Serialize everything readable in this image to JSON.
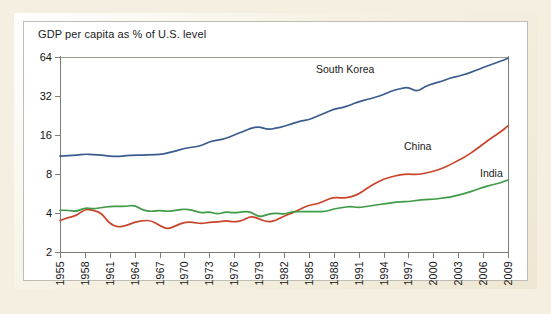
{
  "chart_title": "GDP per capita as % of U.S. level",
  "labels": {
    "south_korea": "South Korea",
    "china": "China",
    "india": "India"
  },
  "colors": {
    "south_korea": "#3b5c8f",
    "china": "#c8452a",
    "india": "#3f9b45",
    "axis": "#7d7d76",
    "frame_cream": "#f4efe0",
    "panel": "#ffffff"
  },
  "y_ticks": [
    "2",
    "4",
    "8",
    "16",
    "32",
    "64"
  ],
  "x_ticks": [
    "1955",
    "1958",
    "1961",
    "1964",
    "1967",
    "1970",
    "1973",
    "1976",
    "1979",
    "1982",
    "1985",
    "1988",
    "1991",
    "1994",
    "1997",
    "2000",
    "2003",
    "2006",
    "2009"
  ],
  "chart_data": {
    "type": "line",
    "title": "GDP per capita as % of U.S. level",
    "xlabel": "",
    "ylabel": "GDP per capita as % of U.S. level",
    "yscale": "log2",
    "ylim": [
      2,
      64
    ],
    "ytick_values": [
      2,
      4,
      8,
      16,
      32,
      64
    ],
    "xlim": [
      1955,
      2009
    ],
    "xtick_values": [
      1955,
      1958,
      1961,
      1964,
      1967,
      1970,
      1973,
      1976,
      1979,
      1982,
      1985,
      1988,
      1991,
      1994,
      1997,
      2000,
      2003,
      2006,
      2009
    ],
    "grid": false,
    "legend": "inline-annotations",
    "x": [
      1955,
      1956,
      1957,
      1958,
      1959,
      1960,
      1961,
      1962,
      1963,
      1964,
      1965,
      1966,
      1967,
      1968,
      1969,
      1970,
      1971,
      1972,
      1973,
      1974,
      1975,
      1976,
      1977,
      1978,
      1979,
      1980,
      1981,
      1982,
      1983,
      1984,
      1985,
      1986,
      1987,
      1988,
      1989,
      1990,
      1991,
      1992,
      1993,
      1994,
      1995,
      1996,
      1997,
      1998,
      1999,
      2000,
      2001,
      2002,
      2003,
      2004,
      2005,
      2006,
      2007,
      2008,
      2009
    ],
    "series": [
      {
        "name": "South Korea",
        "color": "#3b5c8f",
        "values": [
          11.0,
          11.1,
          11.2,
          11.4,
          11.3,
          11.2,
          11.0,
          10.9,
          11.1,
          11.2,
          11.2,
          11.3,
          11.3,
          11.6,
          12.1,
          12.6,
          12.9,
          13.2,
          14.2,
          14.6,
          15.0,
          16.0,
          17.0,
          18.0,
          18.6,
          17.6,
          18.0,
          18.6,
          19.6,
          20.5,
          21.0,
          22.3,
          23.8,
          25.3,
          26.0,
          27.2,
          29.0,
          30.0,
          31.2,
          32.8,
          35.0,
          36.5,
          37.5,
          34.5,
          37.8,
          40.0,
          41.5,
          44.0,
          45.5,
          47.5,
          50.0,
          53.0,
          56.0,
          59.0,
          62.5
        ]
      },
      {
        "name": "China",
        "color": "#c8452a",
        "values": [
          3.5,
          3.7,
          3.8,
          4.3,
          4.2,
          4.0,
          3.3,
          3.1,
          3.2,
          3.4,
          3.5,
          3.5,
          3.2,
          3.0,
          3.2,
          3.4,
          3.4,
          3.3,
          3.4,
          3.4,
          3.5,
          3.4,
          3.5,
          3.8,
          3.6,
          3.4,
          3.5,
          3.8,
          4.0,
          4.3,
          4.6,
          4.7,
          5.0,
          5.3,
          5.2,
          5.3,
          5.6,
          6.2,
          6.8,
          7.3,
          7.6,
          7.9,
          8.0,
          7.9,
          8.1,
          8.4,
          8.8,
          9.4,
          10.2,
          11.0,
          12.2,
          13.6,
          15.2,
          16.7,
          18.8
        ]
      },
      {
        "name": "India",
        "color": "#3f9b45",
        "values": [
          4.2,
          4.2,
          4.1,
          4.4,
          4.3,
          4.4,
          4.5,
          4.5,
          4.5,
          4.6,
          4.2,
          4.1,
          4.2,
          4.1,
          4.2,
          4.3,
          4.2,
          4.0,
          4.1,
          3.9,
          4.1,
          4.0,
          4.1,
          4.1,
          3.7,
          3.9,
          4.0,
          3.9,
          4.1,
          4.1,
          4.1,
          4.1,
          4.1,
          4.3,
          4.4,
          4.5,
          4.4,
          4.5,
          4.6,
          4.7,
          4.8,
          4.9,
          4.9,
          5.0,
          5.1,
          5.1,
          5.2,
          5.3,
          5.5,
          5.7,
          6.0,
          6.3,
          6.6,
          6.8,
          7.2
        ]
      }
    ]
  }
}
